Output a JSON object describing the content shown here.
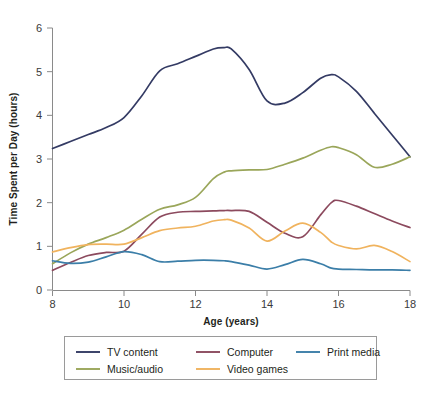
{
  "chart_data": {
    "type": "line",
    "title": "",
    "xlabel": "Age (years)",
    "ylabel": "Time Spent per Day  (hours)",
    "xlim": [
      8,
      18
    ],
    "ylim": [
      0,
      6
    ],
    "xticks": [
      "8",
      "10",
      "12",
      "14",
      "16",
      "18"
    ],
    "xtick_values": [
      8,
      10,
      12,
      14,
      16,
      18
    ],
    "yticks": [
      "0",
      "1",
      "2",
      "3",
      "4",
      "5",
      "6"
    ],
    "ytick_values": [
      0,
      1,
      2,
      3,
      4,
      5,
      6
    ],
    "grid": false,
    "legend_position": "below-plot",
    "x": [
      8,
      8.5,
      9,
      9.5,
      10,
      10.5,
      11,
      11.5,
      12,
      12.5,
      12.8,
      13,
      13.5,
      14,
      14.5,
      15,
      15.5,
      15.8,
      16,
      16.5,
      17,
      17.5,
      18
    ],
    "series": [
      {
        "name": "TV content",
        "color": "#343b64",
        "values": [
          3.24,
          3.4,
          3.56,
          3.72,
          3.95,
          4.45,
          5.02,
          5.18,
          5.35,
          5.52,
          5.55,
          5.52,
          5.05,
          4.33,
          4.28,
          4.52,
          4.85,
          4.93,
          4.88,
          4.55,
          4.05,
          3.55,
          3.05
        ]
      },
      {
        "name": "Music/audio",
        "color": "#9aa65a",
        "values": [
          0.6,
          0.85,
          1.05,
          1.2,
          1.37,
          1.62,
          1.85,
          1.95,
          2.12,
          2.55,
          2.7,
          2.73,
          2.75,
          2.76,
          2.88,
          3.02,
          3.2,
          3.28,
          3.26,
          3.1,
          2.81,
          2.88,
          3.05
        ]
      },
      {
        "name": "Computer",
        "color": "#8c4a5e",
        "values": [
          0.45,
          0.63,
          0.79,
          0.86,
          0.89,
          1.28,
          1.67,
          1.78,
          1.8,
          1.81,
          1.82,
          1.82,
          1.8,
          1.55,
          1.3,
          1.22,
          1.72,
          2.0,
          2.05,
          1.92,
          1.75,
          1.58,
          1.43
        ]
      },
      {
        "name": "Video games",
        "color": "#f0b35e",
        "values": [
          0.87,
          0.97,
          1.04,
          1.05,
          1.05,
          1.2,
          1.36,
          1.42,
          1.46,
          1.58,
          1.61,
          1.6,
          1.42,
          1.12,
          1.35,
          1.53,
          1.32,
          1.1,
          1.02,
          0.94,
          1.02,
          0.88,
          0.65
        ]
      },
      {
        "name": "Print media",
        "color": "#3b7ea8",
        "values": [
          0.67,
          0.61,
          0.64,
          0.76,
          0.88,
          0.81,
          0.65,
          0.66,
          0.68,
          0.68,
          0.67,
          0.65,
          0.57,
          0.48,
          0.58,
          0.7,
          0.6,
          0.5,
          0.48,
          0.47,
          0.46,
          0.46,
          0.45
        ]
      }
    ]
  },
  "legend": {
    "entries": [
      {
        "label": "TV content",
        "color": "#343b64"
      },
      {
        "label": "Music/audio",
        "color": "#9aa65a"
      },
      {
        "label": "Computer",
        "color": "#8c4a5e"
      },
      {
        "label": "Video games",
        "color": "#f0b35e"
      },
      {
        "label": "Print media",
        "color": "#3b7ea8"
      }
    ]
  }
}
